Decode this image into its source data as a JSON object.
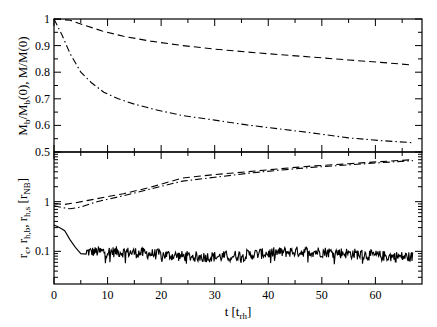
{
  "chart_data": [
    {
      "panel": "top",
      "type": "line",
      "title": "",
      "xlabel": "t [t_rh]",
      "ylabel": "M_b/M_b(0), M/M(0)",
      "xlim": [
        0,
        68.7
      ],
      "ylim": [
        0.5,
        1.0
      ],
      "yscale": "linear",
      "yticks": [
        0.5,
        0.6,
        0.7,
        0.8,
        0.9,
        1.0
      ],
      "ytick_labels": [
        "0.5",
        "0.6",
        "0.7",
        "0.8",
        "0.9",
        "1"
      ],
      "grid": false,
      "legend": null,
      "series": [
        {
          "name": "M/M(0)",
          "style": "dashed",
          "x": [
            0,
            3,
            6,
            9,
            13,
            18,
            24,
            30,
            36,
            42,
            48,
            55,
            61,
            67
          ],
          "y": [
            1.0,
            0.995,
            0.975,
            0.955,
            0.935,
            0.917,
            0.9,
            0.887,
            0.876,
            0.866,
            0.857,
            0.846,
            0.837,
            0.827
          ]
        },
        {
          "name": "M_b/M_b(0)",
          "style": "dashdot",
          "x": [
            0,
            1.5,
            3,
            5,
            7,
            9.3,
            12,
            15,
            18.7,
            24,
            30,
            36,
            42,
            48,
            55,
            61,
            67
          ],
          "y": [
            1.0,
            0.94,
            0.87,
            0.8,
            0.76,
            0.725,
            0.7,
            0.68,
            0.66,
            0.637,
            0.62,
            0.602,
            0.587,
            0.572,
            0.553,
            0.543,
            0.535
          ]
        }
      ]
    },
    {
      "panel": "bottom",
      "type": "line",
      "title": "",
      "xlabel": "t [t_rh]",
      "ylabel": "r_c, r_h,b, r_h,s [r_NB]",
      "xlim": [
        0,
        68.7
      ],
      "ylim": [
        0.022,
        10
      ],
      "yscale": "log",
      "yticks": [
        0.1,
        1
      ],
      "ytick_labels": [
        "0.1",
        "1"
      ],
      "xticks": [
        0,
        10,
        20,
        30,
        40,
        50,
        60
      ],
      "xtick_labels": [
        "0",
        "10",
        "20",
        "30",
        "40",
        "50",
        "60"
      ],
      "grid": false,
      "legend": null,
      "series": [
        {
          "name": "r_h,s",
          "style": "dashed",
          "x": [
            0,
            2,
            4,
            8,
            13,
            18,
            24,
            30,
            36,
            42,
            48,
            55,
            61,
            67
          ],
          "y": [
            0.92,
            0.88,
            0.95,
            1.15,
            1.45,
            1.95,
            3.0,
            3.5,
            4.0,
            4.6,
            5.2,
            5.8,
            6.4,
            7.0
          ]
        },
        {
          "name": "r_h,b",
          "style": "dashdot",
          "x": [
            0,
            1.5,
            3,
            5,
            8,
            13,
            18,
            24,
            30,
            36,
            42,
            48,
            55,
            61,
            67
          ],
          "y": [
            0.83,
            0.76,
            0.72,
            0.78,
            1.0,
            1.32,
            1.8,
            2.6,
            3.1,
            3.7,
            4.3,
            4.9,
            5.5,
            6.1,
            6.7
          ]
        },
        {
          "name": "r_c",
          "style": "solid",
          "x": [
            0,
            1,
            2,
            3,
            4,
            5,
            6
          ],
          "y": [
            0.34,
            0.3,
            0.26,
            0.17,
            0.12,
            0.09,
            0.088
          ],
          "noise_after_t": 5,
          "noise_level_mean": 0.088,
          "noise_range": [
            0.055,
            0.13
          ],
          "x_end": 67
        }
      ]
    }
  ],
  "axes": {
    "top_ylabel": "M_b/M_b(0), M/M(0)",
    "bottom_ylabel": "r_c, r_h,b, r_h,s [r_NB]",
    "xlabel": "t [t_rh]",
    "top_ytick_labels": [
      "1",
      "0.9",
      "0.8",
      "0.7",
      "0.6",
      "0.5"
    ],
    "bottom_ytick_labels": [
      "1",
      "0.1"
    ],
    "xtick_labels": [
      "0",
      "10",
      "20",
      "30",
      "40",
      "50",
      "60"
    ]
  }
}
